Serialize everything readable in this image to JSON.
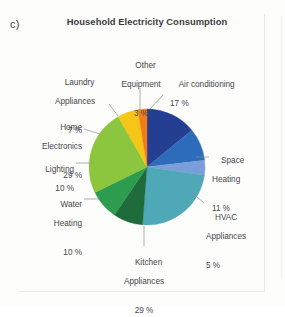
{
  "figure": {
    "subfigure_label": "c)",
    "title": "Household Electricity Consumption"
  },
  "chart_data": {
    "type": "pie",
    "title": "Household Electricity Consumption",
    "xlabel": "",
    "ylabel": "",
    "legend_position": "none",
    "labels_outside": true,
    "categories": [
      "Air conditioning",
      "Space Heating",
      "HVAC Appliances",
      "Kitchen Appliances",
      "Water Heating",
      "Lighting",
      "Home Electronics",
      "Laundry Appliances",
      "Other Equipment"
    ],
    "values": [
      17,
      11,
      5,
      29,
      10,
      10,
      29,
      7,
      3
    ],
    "value_labels": [
      "17 %",
      "11 %",
      "5 %",
      "29 %",
      "10 %",
      "10 %",
      "29 %",
      "7 %",
      "3 %"
    ],
    "unit": "%",
    "colors": [
      "#243f92",
      "#2d6cba",
      "#7b9edb",
      "#4fa8b8",
      "#1f6b3b",
      "#2e9c4e",
      "#8cc63f",
      "#f5c518",
      "#f07d18"
    ],
    "slices": [
      {
        "label": "Air conditioning",
        "value_label": "17 %",
        "color": "#243f92"
      },
      {
        "label": "Space Heating",
        "value_label": "11 %",
        "color": "#2d6cba"
      },
      {
        "label": "HVAC Appliances",
        "value_label": "5 %",
        "color": "#7b9edb"
      },
      {
        "label": "Kitchen Appliances",
        "value_label": "29 %",
        "color": "#4fa8b8"
      },
      {
        "label": "Water Heating",
        "value_label": "10 %",
        "color": "#1f6b3b"
      },
      {
        "label": "Lighting",
        "value_label": "10 %",
        "color": "#2e9c4e"
      },
      {
        "label": "Home Electronics",
        "value_label": "29 %",
        "color": "#8cc63f"
      },
      {
        "label": "Laundry Appliances",
        "value_label": "7 %",
        "color": "#f5c518"
      },
      {
        "label": "Other Equipment",
        "value_label": "3 %",
        "color": "#f07d18"
      }
    ]
  },
  "callouts": {
    "air_conditioning": {
      "name": "Air conditioning",
      "pct": "17 %"
    },
    "space_heating": {
      "name": "Space",
      "name2": "Heating",
      "pct": "11 %"
    },
    "hvac_appliances": {
      "name": "HVAC",
      "name2": "Appliances",
      "pct": "5 %"
    },
    "kitchen_appliances": {
      "name": "Kitchen",
      "name2": "Appliances",
      "pct": "29 %"
    },
    "water_heating": {
      "name": "Water",
      "name2": "Heating",
      "pct": "10 %"
    },
    "lighting": {
      "name": "Lighting",
      "pct": "10 %"
    },
    "home_electronics": {
      "name": "Home",
      "name2": "Electronics",
      "pct": "29 %"
    },
    "laundry_appliances": {
      "name": "Laundry",
      "name2": "Appliances",
      "pct": "7 %"
    },
    "other_equipment": {
      "name": "Other",
      "name2": "Equipment",
      "pct": "3 %"
    }
  }
}
